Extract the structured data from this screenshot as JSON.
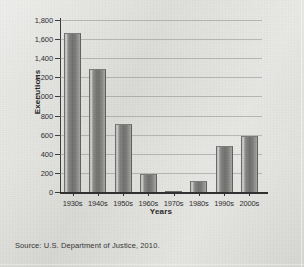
{
  "chart_data": {
    "type": "bar",
    "title": "",
    "xlabel": "Years",
    "ylabel": "Executions",
    "categories": [
      "1930s",
      "1940s",
      "1950s",
      "1960s",
      "1970s",
      "1980s",
      "1990s",
      "2000s"
    ],
    "values": [
      1667,
      1284,
      717,
      191,
      3,
      117,
      478,
      590
    ],
    "ylim": [
      0,
      1800
    ],
    "ytick_values": [
      0,
      200,
      400,
      600,
      800,
      1000,
      1200,
      1400,
      1600,
      1800
    ],
    "ytick_labels": [
      "0",
      "200",
      "400",
      "600",
      "800",
      "1,000",
      "1,200",
      "1,400",
      "1,600",
      "1,800"
    ],
    "grid": true,
    "legend": false,
    "legend_position": "none",
    "bar_color": "#7c7c7a",
    "source": "Source: U.S. Department of Justice, 2010."
  },
  "figure": {
    "background_color": "#d9d9d5",
    "axis_color": "#2e2e2e",
    "text_color": "#2b2b2b"
  }
}
